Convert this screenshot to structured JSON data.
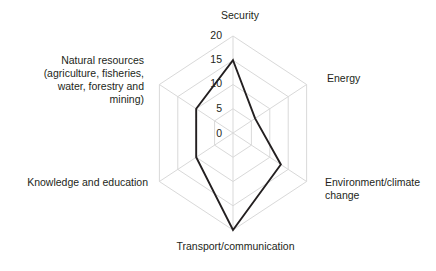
{
  "chart_data": {
    "type": "radar",
    "title": "",
    "subtitle": "",
    "xlabel": "",
    "ylabel": "",
    "categories": [
      "Security",
      "Energy",
      "Environment/climate\nchange",
      "Transport/communication",
      "Knowledge and education",
      "Natural resources\n(agriculture, fisheries,\nwater, forestry and\nmining)"
    ],
    "values": [
      15,
      6,
      13,
      20,
      10,
      10
    ],
    "series": [
      {
        "name": "",
        "values": [
          15,
          6,
          13,
          20,
          10,
          10
        ]
      }
    ],
    "tick_labels": [
      "0",
      "5",
      "10",
      "15",
      "20"
    ],
    "tick_values": [
      0,
      5,
      10,
      15,
      20
    ],
    "rlim": [
      0,
      20
    ],
    "grid": true,
    "legend": "none",
    "grid_color": "#d9d9d9",
    "line_color": "#231f20",
    "background_color": "#ffffff"
  },
  "axis_labels": {
    "security": "Security",
    "energy": "Energy",
    "environment": "Environment/climate change",
    "transport": "Transport/communication",
    "knowledge": "Knowledge and education",
    "natural_resources": "Natural resources (agriculture, fisheries, water, forestry and mining)"
  },
  "ticks": {
    "t0": "0",
    "t5": "5",
    "t10": "10",
    "t15": "15",
    "t20": "20"
  }
}
